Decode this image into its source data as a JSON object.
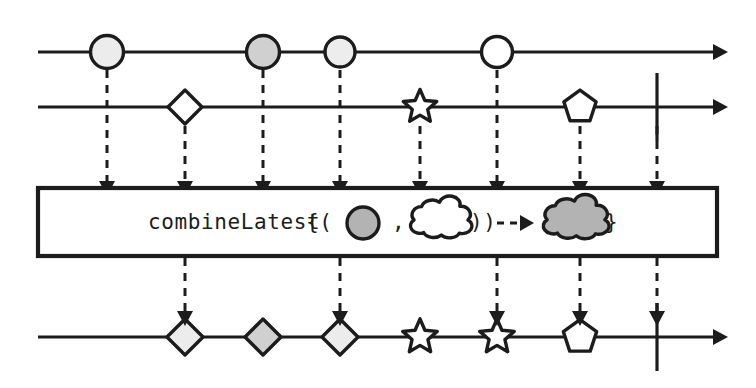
{
  "diagram": {
    "kind": "rxjs-marble-diagram",
    "operator_name": "combineLatest",
    "background_color": "#ffffff",
    "ink_color": "#1c1c1c",
    "canvas": {
      "width": 756,
      "height": 388
    }
  },
  "palette": {
    "white": "#ffffff",
    "light_gray": "#ececec",
    "mid_gray": "#d9d9d9",
    "dark_gray": "#b3b3b3",
    "ink": "#1c1c1c"
  },
  "operator_box": {
    "label_prefix": "combineLatest",
    "bracket_open": "{(",
    "separator": ",",
    "bracket_close": "))",
    "bracket_end": "}",
    "arrow_glyph": "- - ▶",
    "input_left_shape": "circle",
    "input_left_fill": "#b3b3b3",
    "input_right_shape": "cloud",
    "input_right_fill": "#ffffff",
    "output_shape": "cloud",
    "output_fill": "#b3b3b3",
    "x": 38,
    "y": 188,
    "width": 679,
    "height": 68
  },
  "streams": [
    {
      "name": "source-stream-a",
      "role": "input",
      "y": 52,
      "line_start_x": 38,
      "line_end_x": 728,
      "has_end_arrow": true,
      "has_complete_bar": false,
      "complete_bar_x": null,
      "marbles": [
        {
          "id": "a1",
          "shape": "circle",
          "cx": 107,
          "fill": "#ececec",
          "size": 33
        },
        {
          "id": "a2",
          "shape": "circle",
          "cx": 263,
          "fill": "#d0d0d0",
          "size": 33
        },
        {
          "id": "a3",
          "shape": "circle",
          "cx": 340,
          "fill": "#ededed",
          "size": 30
        },
        {
          "id": "a4",
          "shape": "circle",
          "cx": 497,
          "fill": "#ffffff",
          "size": 31
        }
      ]
    },
    {
      "name": "source-stream-b",
      "role": "input",
      "y": 107,
      "line_start_x": 38,
      "line_end_x": 728,
      "has_end_arrow": true,
      "has_complete_bar": true,
      "complete_bar_x": 657,
      "marbles": [
        {
          "id": "b1",
          "shape": "diamond",
          "cx": 185,
          "fill": "#ffffff",
          "size": 32
        },
        {
          "id": "b2",
          "shape": "star",
          "cx": 420,
          "fill": "#ffffff",
          "size": 32
        },
        {
          "id": "b3",
          "shape": "pentagon",
          "cx": 580,
          "fill": "#ffffff",
          "size": 32
        }
      ]
    },
    {
      "name": "result-stream",
      "role": "output",
      "y": 337,
      "line_start_x": 38,
      "line_end_x": 728,
      "has_end_arrow": true,
      "has_complete_bar": true,
      "complete_bar_x": 657,
      "marbles": [
        {
          "id": "r1",
          "shape": "diamond",
          "cx": 185,
          "fill": "#ececec",
          "size": 34
        },
        {
          "id": "r2",
          "shape": "diamond",
          "cx": 263,
          "fill": "#d0d0d0",
          "size": 34
        },
        {
          "id": "r3",
          "shape": "diamond",
          "cx": 340,
          "fill": "#ececec",
          "size": 34
        },
        {
          "id": "r4",
          "shape": "star",
          "cx": 420,
          "fill": "#ffffff",
          "size": 33
        },
        {
          "id": "r5",
          "shape": "star",
          "cx": 497,
          "fill": "#ffffff",
          "size": 33
        },
        {
          "id": "r6",
          "shape": "pentagon",
          "cx": 580,
          "fill": "#ffffff",
          "size": 33
        }
      ]
    }
  ],
  "input_links": [
    {
      "name": "link-a1",
      "x": 107,
      "from_y": 70,
      "to_y": 186
    },
    {
      "name": "link-b1",
      "x": 185,
      "from_y": 126,
      "to_y": 186
    },
    {
      "name": "link-a2",
      "x": 263,
      "from_y": 70,
      "to_y": 186
    },
    {
      "name": "link-a3",
      "x": 340,
      "from_y": 70,
      "to_y": 186
    },
    {
      "name": "link-b2",
      "x": 420,
      "from_y": 126,
      "to_y": 186
    },
    {
      "name": "link-a4",
      "x": 497,
      "from_y": 70,
      "to_y": 186
    },
    {
      "name": "link-b3",
      "x": 580,
      "from_y": 126,
      "to_y": 186
    },
    {
      "name": "link-b-complete",
      "x": 657,
      "from_y": 126,
      "to_y": 186
    }
  ],
  "output_links": [
    {
      "name": "link-r1",
      "x": 185,
      "from_y": 258,
      "to_y": 316
    },
    {
      "name": "link-r3",
      "x": 340,
      "from_y": 258,
      "to_y": 316
    },
    {
      "name": "link-r5",
      "x": 497,
      "from_y": 258,
      "to_y": 316
    },
    {
      "name": "link-r6",
      "x": 580,
      "from_y": 258,
      "to_y": 316
    },
    {
      "name": "link-r-complete",
      "x": 657,
      "from_y": 258,
      "to_y": 316
    }
  ]
}
